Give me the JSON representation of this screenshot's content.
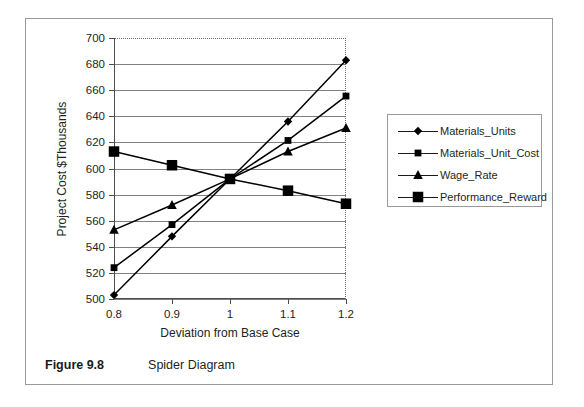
{
  "figure": {
    "caption_label": "Figure 9.8",
    "caption_text": "Spider Diagram"
  },
  "chart_data": {
    "type": "line",
    "title": "",
    "subtitle": "",
    "xlabel": "Deviation from Base Case",
    "ylabel": "Project Cost $Thousands",
    "x": [
      0.8,
      0.9,
      1,
      1.1,
      1.2
    ],
    "categories": [
      "0.8",
      "0.9",
      "1",
      "1.1",
      "1.2"
    ],
    "xlim": [
      0.8,
      1.2
    ],
    "ylim": [
      500,
      700
    ],
    "y_ticks": [
      500,
      520,
      540,
      560,
      580,
      600,
      620,
      640,
      660,
      680,
      700
    ],
    "x_ticks": [
      "0.8",
      "0.9",
      "1",
      "1.1",
      "1.2"
    ],
    "grid": "horizontal",
    "legend_position": "right",
    "series": [
      {
        "name": "Materials_Units",
        "marker": "diamond",
        "color": "#000000",
        "values": [
          503,
          548,
          592,
          636,
          683
        ]
      },
      {
        "name": "Materials_Unit_Cost",
        "marker": "square",
        "color": "#000000",
        "values": [
          524,
          557,
          592,
          621.5,
          655.5
        ]
      },
      {
        "name": "Wage_Rate",
        "marker": "triangle",
        "color": "#000000",
        "values": [
          553,
          572,
          592,
          613,
          631
        ]
      },
      {
        "name": "Performance_Reward",
        "marker": "large-square",
        "color": "#000000",
        "values": [
          613,
          602.5,
          592,
          583,
          573
        ]
      }
    ]
  },
  "legend": {
    "items": [
      {
        "label": "Materials_Units",
        "marker": "diamond"
      },
      {
        "label": "Materials_Unit_Cost",
        "marker": "square"
      },
      {
        "label": "Wage_Rate",
        "marker": "triangle"
      },
      {
        "label": "Performance_Reward",
        "marker": "large-square"
      }
    ]
  },
  "axis_labels": {
    "y": [
      "700",
      "680",
      "660",
      "640",
      "620",
      "600",
      "580",
      "560",
      "540",
      "520",
      "500"
    ],
    "x": [
      "0.8",
      "0.9",
      "1",
      "1.1",
      "1.2"
    ]
  },
  "colors": {
    "line": "#000000",
    "grid": "#808080",
    "axis": "#4d4d4d",
    "border": "#9a9a9a",
    "text": "#231f20"
  }
}
